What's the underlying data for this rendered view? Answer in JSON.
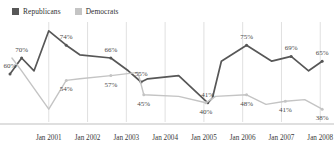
{
  "legend": {
    "position": "top-left",
    "items": [
      {
        "label": "Republicans",
        "color": "#575757",
        "name": "republicans"
      },
      {
        "label": "Democrats",
        "color": "#c4c4c4",
        "name": "democrats"
      }
    ]
  },
  "chart_data": {
    "type": "line",
    "title": "",
    "subtitle": "",
    "xlabel": "",
    "ylabel": "",
    "grid": "vertical-gridlines-at-each-year",
    "ylim": [
      30,
      90
    ],
    "axis_baseline": true,
    "categories": [
      "Jan 2001",
      "Jan 2002",
      "Jan 2003",
      "Jan 2004",
      "Jan 2005",
      "Jan 2006",
      "Jan 2007",
      "Jan 2008"
    ],
    "series": [
      {
        "name": "Republicans",
        "color": "#575757",
        "points": [
          {
            "x": 0.0,
            "y": 60,
            "label": "60%"
          },
          {
            "x": 0.3,
            "y": 70,
            "label": "70%"
          },
          {
            "x": 0.62,
            "y": 62,
            "label": ""
          },
          {
            "x": 1.0,
            "y": 87,
            "label": ""
          },
          {
            "x": 1.45,
            "y": 78,
            "label": "74%"
          },
          {
            "x": 1.8,
            "y": 72,
            "label": ""
          },
          {
            "x": 2.6,
            "y": 70,
            "label": "66%"
          },
          {
            "x": 3.05,
            "y": 62,
            "label": ""
          },
          {
            "x": 3.38,
            "y": 55,
            "label": "55%"
          },
          {
            "x": 3.55,
            "y": 57,
            "label": ""
          },
          {
            "x": 4.35,
            "y": 59,
            "label": ""
          },
          {
            "x": 5.1,
            "y": 42,
            "label": "41%"
          },
          {
            "x": 5.22,
            "y": 45,
            "label": ""
          },
          {
            "x": 5.45,
            "y": 68,
            "label": ""
          },
          {
            "x": 6.1,
            "y": 78,
            "label": "75%"
          },
          {
            "x": 6.75,
            "y": 68,
            "label": ""
          },
          {
            "x": 7.25,
            "y": 71,
            "label": "69%"
          },
          {
            "x": 7.7,
            "y": 62,
            "label": ""
          },
          {
            "x": 8.05,
            "y": 68,
            "label": "65%"
          }
        ]
      },
      {
        "name": "Democrats",
        "color": "#c4c4c4",
        "points": [
          {
            "x": 0.05,
            "y": 70,
            "label": ""
          },
          {
            "x": 0.3,
            "y": 62,
            "label": ""
          },
          {
            "x": 1.0,
            "y": 38,
            "label": ""
          },
          {
            "x": 1.45,
            "y": 56,
            "label": "54%"
          },
          {
            "x": 1.8,
            "y": 57,
            "label": ""
          },
          {
            "x": 2.6,
            "y": 59,
            "label": "57%"
          },
          {
            "x": 3.3,
            "y": 61,
            "label": ""
          },
          {
            "x": 3.45,
            "y": 47,
            "label": "45%"
          },
          {
            "x": 4.35,
            "y": 46,
            "label": ""
          },
          {
            "x": 5.05,
            "y": 42,
            "label": "40%"
          },
          {
            "x": 5.3,
            "y": 46,
            "label": ""
          },
          {
            "x": 6.1,
            "y": 47,
            "label": "48%"
          },
          {
            "x": 6.6,
            "y": 41,
            "label": ""
          },
          {
            "x": 7.1,
            "y": 43,
            "label": "41%"
          },
          {
            "x": 7.6,
            "y": 44,
            "label": ""
          },
          {
            "x": 8.05,
            "y": 38,
            "label": "38%"
          }
        ]
      }
    ],
    "data_labels": {
      "republicans": [
        "60%",
        "70%",
        "74%",
        "66%",
        "55%",
        "41%",
        "75%",
        "69%",
        "65%"
      ],
      "democrats": [
        "54%",
        "57%",
        "45%",
        "40%",
        "48%",
        "41%",
        "38%"
      ]
    }
  },
  "colors": {
    "republican": "#575757",
    "democrat": "#c4c4c4",
    "gridline": "#d8d8d8",
    "axis": "#b8b8b8",
    "text": "#3a3a3a"
  }
}
